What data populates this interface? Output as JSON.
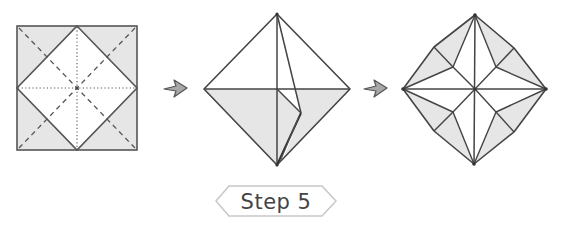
{
  "diagram": {
    "step_label": "Step 5",
    "colors": {
      "paper_colored": "#e6e6e6",
      "paper_white": "#ffffff",
      "line": "#444444",
      "arrow_fill": "#a8a8a8",
      "label_border": "#c8c8c8",
      "label_text": "#444444"
    },
    "panels": [
      {
        "id": "panel-1",
        "description": "Square with inscribed diamond, dashed diagonals (valley folds) and dotted center creases"
      },
      {
        "id": "panel-2",
        "description": "Diamond with one flap being folded on the right lower quadrant"
      },
      {
        "id": "panel-3",
        "description": "Result: octagonal star-like shape with gray triangular flaps"
      }
    ],
    "arrows": [
      {
        "id": "arrow-1",
        "from": "panel-1",
        "to": "panel-2"
      },
      {
        "id": "arrow-2",
        "from": "panel-2",
        "to": "panel-3"
      }
    ]
  }
}
